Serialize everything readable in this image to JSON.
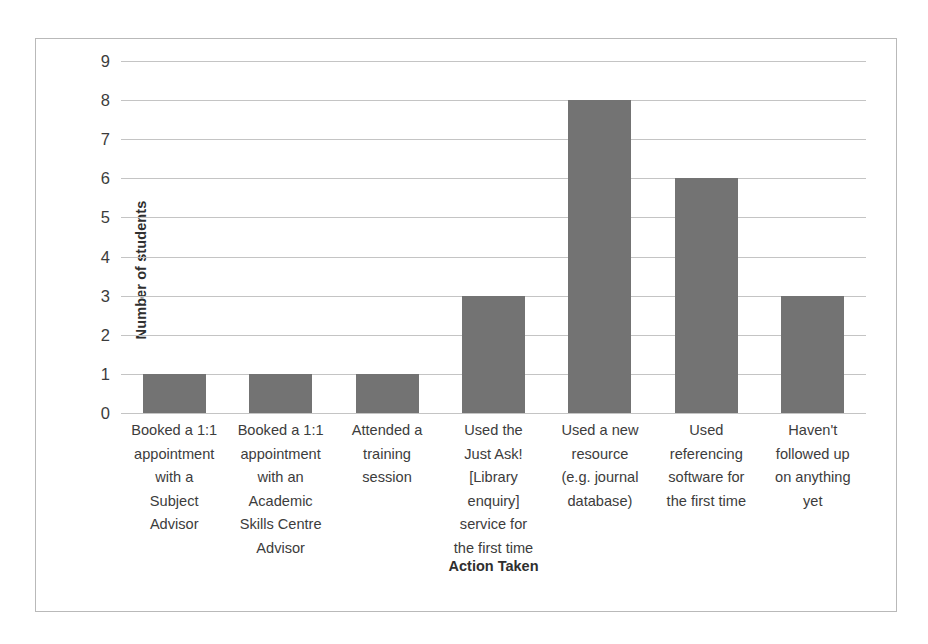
{
  "chart_data": {
    "type": "bar",
    "title": "",
    "xlabel": "Action Taken",
    "ylabel": "Number of students",
    "categories": [
      "Booked a 1:1 appointment with a Subject Advisor",
      "Booked a 1:1 appointment with an Academic Skills Centre Advisor",
      "Attended a training session",
      "Used the Just Ask! [Library enquiry] service for the first time",
      "Used a new resource (e.g. journal database)",
      "Used referencing software for the first time",
      "Haven't followed up on anything yet"
    ],
    "category_lines": [
      [
        "Booked a 1:1",
        "appointment",
        "with a",
        "Subject",
        "Advisor"
      ],
      [
        "Booked a 1:1",
        "appointment",
        "with an",
        "Academic",
        "Skills Centre",
        "Advisor"
      ],
      [
        "Attended a",
        "training",
        "session"
      ],
      [
        "Used the",
        "Just Ask!",
        "[Library",
        "enquiry]",
        "service for",
        "the first time"
      ],
      [
        "Used a new",
        "resource",
        "(e.g. journal",
        "database)"
      ],
      [
        "Used",
        "referencing",
        "software for",
        "the first time"
      ],
      [
        "Haven't",
        "followed up",
        "on anything",
        "yet"
      ]
    ],
    "values": [
      1,
      1,
      1,
      3,
      8,
      6,
      3
    ],
    "ylim": [
      0,
      9
    ],
    "ytick_labels": [
      "0",
      "1",
      "2",
      "3",
      "4",
      "5",
      "6",
      "7",
      "8",
      "9"
    ],
    "grid": true,
    "legend": "none",
    "bar_color": "#737373",
    "gridline_color": "#c4c4c4",
    "border_color": "#b9b9b9",
    "text_color": "#3c3c3c"
  }
}
